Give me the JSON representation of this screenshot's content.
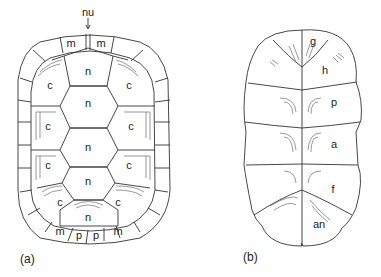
{
  "figure": {
    "panels": [
      {
        "id": "a",
        "caption": "(a)",
        "subject": "carapace",
        "labels": {
          "nuchal": "nu",
          "marginal_top_left": "m",
          "marginal_top_right": "m",
          "neural_1": "n",
          "neural_2": "n",
          "neural_3": "n",
          "neural_4": "n",
          "neural_5": "n",
          "costal_1_left": "c",
          "costal_1_right": "c",
          "costal_2_left": "c",
          "costal_2_right": "c",
          "costal_3_left": "c",
          "costal_3_right": "c",
          "costal_4_left": "c",
          "costal_4_right": "c",
          "marginal_bottom_left": "m",
          "pygal_left": "p",
          "pygal_right": "p",
          "marginal_bottom_right": "m"
        }
      },
      {
        "id": "b",
        "caption": "(b)",
        "subject": "plastron",
        "labels": {
          "gular": "g",
          "humeral": "h",
          "pectoral": "p",
          "abdominal": "a",
          "femoral": "f",
          "anal": "an"
        }
      }
    ],
    "colors": {
      "line": "#333333",
      "text": "#222222",
      "background": "#ffffff"
    }
  }
}
